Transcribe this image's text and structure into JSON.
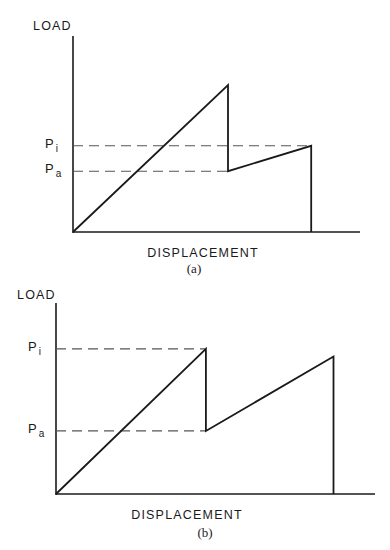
{
  "chart_data": [
    {
      "type": "line",
      "caption": "(a)",
      "xlabel": "DISPLACEMENT",
      "ylabel": "LOAD",
      "reference_lines": [
        {
          "label": "P",
          "subscript": "i",
          "value": 0.44
        },
        {
          "label": "P",
          "subscript": "a",
          "value": 0.31
        }
      ],
      "series": [
        {
          "name": "load-displacement",
          "points": [
            [
              0,
              0
            ],
            [
              0.54,
              0.75
            ],
            [
              0.54,
              0.31
            ],
            [
              0.83,
              0.44
            ],
            [
              0.83,
              0
            ]
          ]
        }
      ],
      "xlim": [
        0,
        1
      ],
      "ylim": [
        0,
        1
      ]
    },
    {
      "type": "line",
      "caption": "(b)",
      "xlabel": "DISPLACEMENT",
      "ylabel": "LOAD",
      "reference_lines": [
        {
          "label": "P",
          "subscript": "i",
          "value": 0.76
        },
        {
          "label": "P",
          "subscript": "a",
          "value": 0.33
        }
      ],
      "series": [
        {
          "name": "load-displacement",
          "points": [
            [
              0,
              0
            ],
            [
              0.47,
              0.76
            ],
            [
              0.47,
              0.33
            ],
            [
              0.87,
              0.72
            ],
            [
              0.87,
              0
            ]
          ]
        }
      ],
      "xlim": [
        0,
        1
      ],
      "ylim": [
        0,
        1
      ]
    }
  ]
}
